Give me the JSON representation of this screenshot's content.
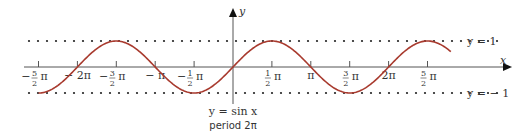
{
  "chart_data": {
    "type": "line",
    "title": "",
    "function": "sin",
    "xlabel": "x",
    "ylabel": "y",
    "xlim_pi": [
      -3.0,
      3.5
    ],
    "ylim": [
      -1.6,
      2.6
    ],
    "curve_domain_pi": [
      -2.5,
      2.8
    ],
    "series": [
      {
        "name": "y = sin x",
        "color": "#a83a2e",
        "x_pi_start": -2.5,
        "x_pi_end": 2.8
      }
    ],
    "x_ticks": [
      {
        "value_pi": -2.5,
        "sign": "−",
        "num": "5",
        "den": "2",
        "sym": "π"
      },
      {
        "value_pi": -2.0,
        "text": "− 2π"
      },
      {
        "value_pi": -1.5,
        "sign": "−",
        "num": "3",
        "den": "2",
        "sym": "π"
      },
      {
        "value_pi": -1.0,
        "text": "− π"
      },
      {
        "value_pi": -0.5,
        "sign": "−",
        "num": "1",
        "den": "2",
        "sym": "π"
      },
      {
        "value_pi": 0.5,
        "sign": "",
        "num": "1",
        "den": "2",
        "sym": "π"
      },
      {
        "value_pi": 1.0,
        "text": "π"
      },
      {
        "value_pi": 1.5,
        "sign": "",
        "num": "3",
        "den": "2",
        "sym": "π"
      },
      {
        "value_pi": 2.0,
        "text": "2π"
      },
      {
        "value_pi": 2.5,
        "sign": "",
        "num": "5",
        "den": "2",
        "sym": "π"
      }
    ],
    "reference_lines": [
      {
        "y": 1,
        "label": "y = 1",
        "style": "dotted"
      },
      {
        "y": -1,
        "label": "y = − 1",
        "style": "dotted"
      }
    ],
    "annotations": [
      "y = sin x",
      "period  2π"
    ],
    "grid": false
  },
  "labels": {
    "x_axis": "x",
    "y_axis": "y",
    "equation": "y = sin x",
    "period": "period  2π",
    "upper_line": "y = 1",
    "lower_line": "y = − 1"
  }
}
